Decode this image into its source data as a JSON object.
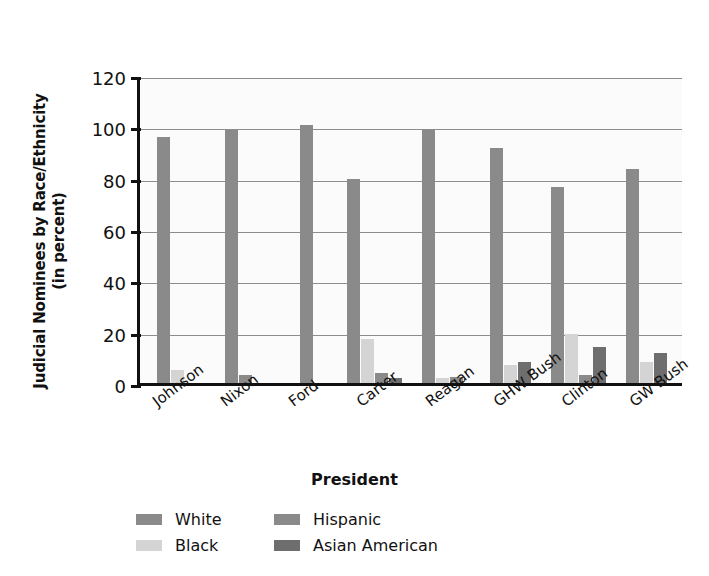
{
  "chart_data": {
    "type": "bar",
    "title": "",
    "xlabel": "President",
    "ylabel": "Judicial Nominees by Race/Ethnicity (in percent)",
    "ylabel_line1": "Judicial Nominees by Race/Ethnicity",
    "ylabel_line2": "(in percent)",
    "categories": [
      "Johnson",
      "Nixon",
      "Ford",
      "Carter",
      "Reagan",
      "GHW Bush",
      "Clinton",
      "GW Bush"
    ],
    "series": [
      {
        "name": "White",
        "color": "#8a8a8a",
        "values": [
          96,
          98.5,
          100.5,
          79.5,
          99,
          91.5,
          76.5,
          83.5
        ]
      },
      {
        "name": "Black",
        "color": "#d4d4d4",
        "values": [
          5,
          0,
          0,
          17,
          2,
          7,
          19,
          8
        ]
      },
      {
        "name": "Hispanic",
        "color": "#8a8a8a",
        "values": [
          0,
          3,
          0,
          4,
          2.5,
          0,
          3,
          0
        ]
      },
      {
        "name": "Asian American",
        "color": "#6e6e6e",
        "values": [
          0,
          0,
          0,
          2,
          0,
          8,
          14,
          11.5
        ]
      }
    ],
    "ylim": [
      0,
      120
    ],
    "yticks": [
      0,
      20,
      40,
      60,
      80,
      100,
      120
    ],
    "ytick_labels": [
      "0",
      "20",
      "40",
      "60",
      "80",
      "100",
      "120"
    ],
    "grid": true,
    "legend_position": "bottom",
    "legend_entries": [
      "White",
      "Black",
      "Hispanic",
      "Asian American"
    ]
  }
}
